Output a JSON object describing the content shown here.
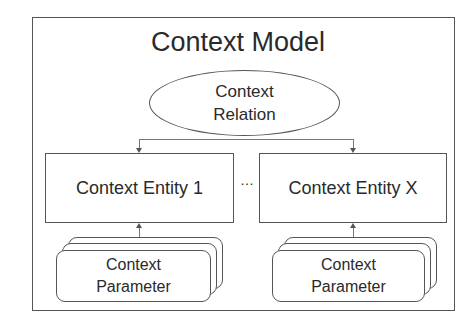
{
  "diagram": {
    "title": "Context Model",
    "relation": {
      "line1": "Context",
      "line2": "Relation"
    },
    "entities": [
      {
        "label": "Context Entity 1"
      },
      {
        "label": "Context Entity X"
      }
    ],
    "separator": "…",
    "parameters": [
      {
        "line1": "Context",
        "line2": "Parameter"
      },
      {
        "line1": "Context",
        "line2": "Parameter"
      }
    ],
    "colors": {
      "stroke": "#555555",
      "text": "#2a2a2a",
      "background": "#ffffff"
    }
  }
}
